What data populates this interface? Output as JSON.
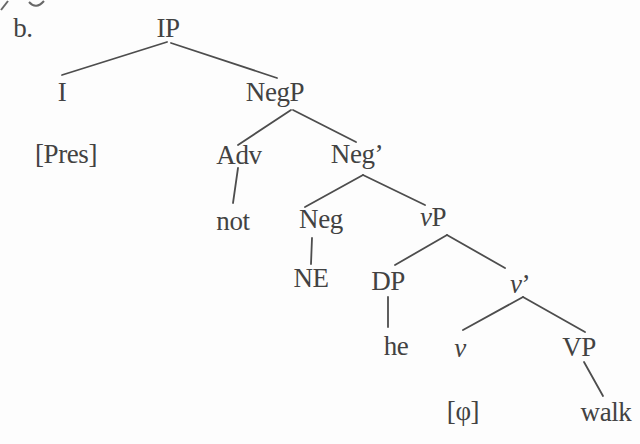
{
  "figure": {
    "item_label": "b.",
    "colors": {
      "text": "#424242",
      "line": "#4d4d4d",
      "background": "#fdfdfd"
    },
    "tree": {
      "nodes": [
        {
          "id": "ip",
          "name": "node-ip",
          "label": "IP",
          "x": 168,
          "y": 28
        },
        {
          "id": "i",
          "name": "node-i",
          "label": "I",
          "x": 62,
          "y": 92
        },
        {
          "id": "negp",
          "name": "node-negp",
          "label": "NegP",
          "x": 275,
          "y": 92
        },
        {
          "id": "pres",
          "name": "node-pres-feature",
          "label": "[Pres]",
          "x": 66,
          "y": 154
        },
        {
          "id": "adv",
          "name": "node-adv",
          "label": "Adv",
          "x": 239,
          "y": 155
        },
        {
          "id": "neg-bar",
          "name": "node-neg-bar",
          "label": "Neg’",
          "x": 357,
          "y": 154
        },
        {
          "id": "not",
          "name": "node-not",
          "label": "not",
          "x": 233,
          "y": 221
        },
        {
          "id": "neg",
          "name": "node-neg",
          "label": "Neg",
          "x": 321,
          "y": 219
        },
        {
          "id": "small-vp",
          "name": "node-small-vp",
          "label": "vP",
          "x": 433,
          "y": 217,
          "parts": [
            {
              "text": "v",
              "italic": true
            },
            {
              "text": "P"
            }
          ]
        },
        {
          "id": "ne",
          "name": "node-ne",
          "label": "NE",
          "x": 311,
          "y": 278
        },
        {
          "id": "dp",
          "name": "node-dp",
          "label": "DP",
          "x": 388,
          "y": 281
        },
        {
          "id": "small-v-bar",
          "name": "node-small-v-bar",
          "label": "v’",
          "x": 520,
          "y": 284,
          "parts": [
            {
              "text": "v",
              "italic": true
            },
            {
              "text": "’"
            }
          ]
        },
        {
          "id": "he",
          "name": "node-he",
          "label": "he",
          "x": 396,
          "y": 346
        },
        {
          "id": "small-v",
          "name": "node-small-v",
          "label": "v",
          "x": 460,
          "y": 348,
          "parts": [
            {
              "text": "v",
              "italic": true
            }
          ]
        },
        {
          "id": "vp",
          "name": "node-vp",
          "label": "VP",
          "x": 579,
          "y": 347
        },
        {
          "id": "phi",
          "name": "node-phi-feature",
          "label": "[φ]",
          "x": 463,
          "y": 411
        },
        {
          "id": "walk",
          "name": "node-walk",
          "label": "walk",
          "x": 606,
          "y": 412
        }
      ],
      "edges": [
        {
          "name": "branch-ip-i",
          "x1": 167,
          "y1": 42,
          "x2": 62,
          "y2": 75
        },
        {
          "name": "branch-ip-negp",
          "x1": 171,
          "y1": 43,
          "x2": 277,
          "y2": 78
        },
        {
          "name": "branch-negp-adv",
          "x1": 291,
          "y1": 110,
          "x2": 238,
          "y2": 145
        },
        {
          "name": "branch-negp-neg-bar",
          "x1": 293,
          "y1": 110,
          "x2": 356,
          "y2": 142
        },
        {
          "name": "branch-adv-not",
          "x1": 238,
          "y1": 168,
          "x2": 233,
          "y2": 203
        },
        {
          "name": "branch-neg-bar-neg",
          "x1": 363,
          "y1": 175,
          "x2": 305,
          "y2": 207
        },
        {
          "name": "branch-neg-bar-small-vp",
          "x1": 363,
          "y1": 175,
          "x2": 425,
          "y2": 205
        },
        {
          "name": "branch-neg-ne",
          "x1": 312,
          "y1": 238,
          "x2": 311,
          "y2": 264
        },
        {
          "name": "branch-small-vp-dp",
          "x1": 447,
          "y1": 235,
          "x2": 395,
          "y2": 265
        },
        {
          "name": "branch-small-vp-small-v-bar",
          "x1": 447,
          "y1": 235,
          "x2": 505,
          "y2": 268
        },
        {
          "name": "branch-dp-he",
          "x1": 388,
          "y1": 297,
          "x2": 388,
          "y2": 327
        },
        {
          "name": "branch-small-v-bar-small-v",
          "x1": 523,
          "y1": 297,
          "x2": 463,
          "y2": 330
        },
        {
          "name": "branch-small-v-bar-vp",
          "x1": 523,
          "y1": 297,
          "x2": 585,
          "y2": 332
        },
        {
          "name": "branch-vp-walk",
          "x1": 584,
          "y1": 362,
          "x2": 603,
          "y2": 396
        }
      ]
    },
    "artifacts": [
      {
        "name": "page-edge-mark-1",
        "d": "M1,10 L8,1"
      },
      {
        "name": "page-edge-mark-2",
        "d": "M29,2 Q36,10 44,1"
      }
    ]
  }
}
